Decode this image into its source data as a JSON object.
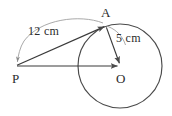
{
  "figure": {
    "stroke_color": "#4a4a4a",
    "text_color": "#2b2b2b",
    "background_color": "#ffffff",
    "points": {
      "A": {
        "label": "A",
        "x": 106,
        "y": 26
      },
      "P": {
        "label": "P",
        "x": 16,
        "y": 66
      },
      "O": {
        "label": "O",
        "x": 120,
        "y": 66
      }
    },
    "circle": {
      "center_x": 120,
      "center_y": 66,
      "radius": 42
    },
    "measurements": {
      "pa_length": "12 cm",
      "oa_radius": "5 cm"
    },
    "segments": [
      {
        "name": "segment-PA",
        "from": "P",
        "to": "A"
      },
      {
        "name": "segment-PO",
        "from": "P",
        "to": "O"
      },
      {
        "name": "segment-AO",
        "from": "A",
        "to": "O"
      }
    ]
  }
}
